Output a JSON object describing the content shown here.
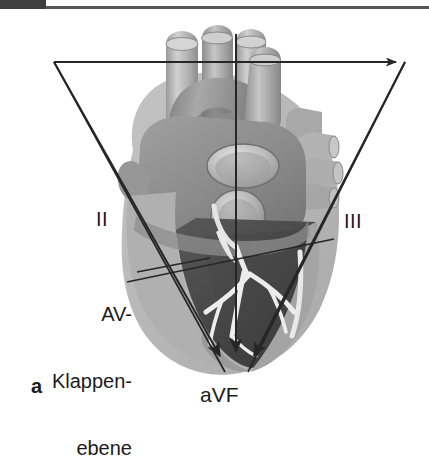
{
  "figure": {
    "part_label": "a",
    "header": {
      "tab_color": "#3f3f3f",
      "rule_color": "#58585a"
    },
    "annotations": {
      "av_plane": {
        "line1": "AV-",
        "line2": "Klappen-",
        "line3": "ebene"
      }
    },
    "leads": [
      {
        "id": "lead-I",
        "label": "",
        "label_shown": false
      },
      {
        "id": "lead-II",
        "label": "II",
        "label_shown": true
      },
      {
        "id": "lead-III",
        "label": "III",
        "label_shown": true
      },
      {
        "id": "lead-aVF",
        "label": "aVF",
        "label_shown": true
      }
    ],
    "colors": {
      "background": "#ffffff",
      "line": "#262626",
      "text": "#1b1b1b",
      "heart_light": "#bdbdbd",
      "heart_mid": "#8a8a8a",
      "heart_dark": "#4a4a4a",
      "heart_darker": "#3a3a3a",
      "conduction": "#ededed",
      "vessel_light": "#c9c9c9",
      "vessel_mid": "#9d9d9d"
    }
  }
}
